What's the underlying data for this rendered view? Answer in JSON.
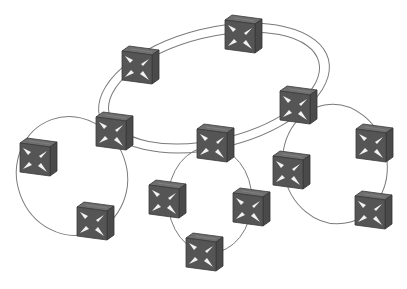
{
  "diagram": {
    "title": "",
    "colors": {
      "background": "#ffffff",
      "link": "#7a7a7a",
      "device_front": "#555555",
      "device_top": "#6e6e6e",
      "device_side": "#4a4a4a",
      "arrow": "#f2f2f2"
    },
    "devices": [
      {
        "id": "d1",
        "x": 122,
        "y": 46,
        "ring": "core"
      },
      {
        "id": "d2",
        "x": 225,
        "y": 15,
        "ring": "core"
      },
      {
        "id": "d3",
        "x": 280,
        "y": 86,
        "ring": "core"
      },
      {
        "id": "d4",
        "x": 197,
        "y": 124,
        "ring": "core"
      },
      {
        "id": "d5",
        "x": 96,
        "y": 112,
        "ring": "core"
      },
      {
        "id": "d6",
        "x": 20,
        "y": 138,
        "ring": "left"
      },
      {
        "id": "d7",
        "x": 77,
        "y": 202,
        "ring": "left"
      },
      {
        "id": "d8",
        "x": 149,
        "y": 180,
        "ring": "bottom"
      },
      {
        "id": "d9",
        "x": 233,
        "y": 188,
        "ring": "bottom"
      },
      {
        "id": "d10",
        "x": 186,
        "y": 233,
        "ring": "bottom"
      },
      {
        "id": "d11",
        "x": 273,
        "y": 151,
        "ring": "right"
      },
      {
        "id": "d12",
        "x": 356,
        "y": 124,
        "ring": "right"
      },
      {
        "id": "d13",
        "x": 355,
        "y": 191,
        "ring": "right"
      }
    ],
    "rings": [
      {
        "name": "core",
        "type": "double",
        "members": [
          "d1",
          "d2",
          "d3",
          "d4",
          "d5"
        ]
      },
      {
        "name": "left",
        "type": "single",
        "members": [
          "d5",
          "d6",
          "d7"
        ]
      },
      {
        "name": "bottom",
        "type": "single",
        "members": [
          "d4",
          "d8",
          "d10",
          "d9"
        ]
      },
      {
        "name": "right",
        "type": "single",
        "members": [
          "d3",
          "d12",
          "d13",
          "d11"
        ]
      }
    ]
  }
}
